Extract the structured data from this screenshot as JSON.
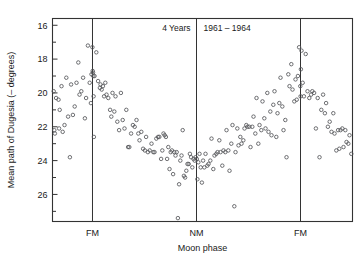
{
  "figure": {
    "title_left": "4 Years",
    "title_right": "1961 – 1964",
    "ylabel": "Mean path of Dugesia (– degrees)",
    "xlabel": "Moon phase",
    "background": "#ffffff",
    "point_color": "#55565a",
    "axis_color": "#333333"
  },
  "chart_data": {
    "type": "scatter",
    "title": "4 Years  1961 – 1964",
    "xlabel": "Moon phase",
    "ylabel": "Mean path of Dugesia (– degrees)",
    "grid": false,
    "legend": null,
    "y_inverted": true,
    "ylim": [
      27.6,
      15.6
    ],
    "yticks": [
      16,
      18,
      20,
      22,
      24,
      26
    ],
    "ytick_labels": [
      "16",
      "18",
      "20",
      "22",
      "24",
      "26"
    ],
    "y_minor_tick_step": 1,
    "xlim": [
      0,
      1
    ],
    "xticks": [
      0.1333,
      0.48,
      0.8267
    ],
    "xtick_labels": [
      "FM",
      "NM",
      "FM"
    ],
    "reference_lines": [
      {
        "label": "FM",
        "x": 0.1333
      },
      {
        "label": "NM",
        "x": 0.48
      },
      {
        "label": "FM",
        "x": 0.8267
      }
    ],
    "n_points": 201,
    "series": [
      {
        "name": "Mean path of Dugesia",
        "marker": "open-circle",
        "points": [
          [
            0.004,
            19.9
          ],
          [
            0.006,
            22.2
          ],
          [
            0.008,
            22.4
          ],
          [
            0.012,
            20.3
          ],
          [
            0.02,
            20.4
          ],
          [
            0.022,
            22.1
          ],
          [
            0.024,
            21.0
          ],
          [
            0.03,
            19.6
          ],
          [
            0.034,
            22.3
          ],
          [
            0.04,
            21.9
          ],
          [
            0.046,
            19.1
          ],
          [
            0.052,
            21.4
          ],
          [
            0.058,
            23.8
          ],
          [
            0.062,
            19.5
          ],
          [
            0.068,
            21.3
          ],
          [
            0.074,
            20.8
          ],
          [
            0.08,
            19.4
          ],
          [
            0.086,
            18.2
          ],
          [
            0.09,
            20.1
          ],
          [
            0.096,
            19.9
          ],
          [
            0.102,
            19.1
          ],
          [
            0.108,
            21.5
          ],
          [
            0.112,
            20.3
          ],
          [
            0.118,
            17.2
          ],
          [
            0.124,
            19.4
          ],
          [
            0.128,
            20.6
          ],
          [
            0.13,
            18.9
          ],
          [
            0.133,
            17.3
          ],
          [
            0.134,
            18.7
          ],
          [
            0.135,
            18.8
          ],
          [
            0.136,
            19.0
          ],
          [
            0.137,
            20.2
          ],
          [
            0.138,
            22.6
          ],
          [
            0.14,
            19.0
          ],
          [
            0.146,
            17.6
          ],
          [
            0.152,
            19.3
          ],
          [
            0.158,
            19.7
          ],
          [
            0.16,
            19.5
          ],
          [
            0.164,
            19.8
          ],
          [
            0.168,
            19.6
          ],
          [
            0.172,
            20.2
          ],
          [
            0.176,
            19.4
          ],
          [
            0.18,
            20.1
          ],
          [
            0.186,
            20.3
          ],
          [
            0.192,
            21.0
          ],
          [
            0.196,
            21.4
          ],
          [
            0.2,
            20.0
          ],
          [
            0.206,
            21.1
          ],
          [
            0.21,
            20.2
          ],
          [
            0.216,
            21.7
          ],
          [
            0.222,
            22.2
          ],
          [
            0.228,
            20.0
          ],
          [
            0.234,
            21.6
          ],
          [
            0.24,
            22.1
          ],
          [
            0.246,
            21.0
          ],
          [
            0.252,
            23.2
          ],
          [
            0.256,
            23.2
          ],
          [
            0.262,
            22.4
          ],
          [
            0.268,
            21.9
          ],
          [
            0.274,
            22.0
          ],
          [
            0.28,
            21.6
          ],
          [
            0.286,
            22.4
          ],
          [
            0.29,
            22.8
          ],
          [
            0.296,
            22.3
          ],
          [
            0.302,
            23.3
          ],
          [
            0.308,
            23.4
          ],
          [
            0.312,
            22.6
          ],
          [
            0.318,
            23.5
          ],
          [
            0.324,
            23.4
          ],
          [
            0.33,
            23.0
          ],
          [
            0.336,
            23.5
          ],
          [
            0.34,
            23.5
          ],
          [
            0.346,
            22.7
          ],
          [
            0.352,
            22.6
          ],
          [
            0.356,
            22.6
          ],
          [
            0.362,
            23.9
          ],
          [
            0.366,
            23.4
          ],
          [
            0.37,
            22.4
          ],
          [
            0.374,
            22.5
          ],
          [
            0.378,
            22.6
          ],
          [
            0.382,
            23.9
          ],
          [
            0.386,
            23.2
          ],
          [
            0.39,
            24.5
          ],
          [
            0.394,
            23.5
          ],
          [
            0.398,
            23.4
          ],
          [
            0.402,
            24.8
          ],
          [
            0.406,
            23.5
          ],
          [
            0.41,
            23.7
          ],
          [
            0.414,
            23.5
          ],
          [
            0.418,
            27.4
          ],
          [
            0.422,
            25.4
          ],
          [
            0.426,
            24.0
          ],
          [
            0.43,
            23.7
          ],
          [
            0.434,
            22.2
          ],
          [
            0.438,
            24.9
          ],
          [
            0.442,
            25.0
          ],
          [
            0.446,
            24.6
          ],
          [
            0.45,
            24.2
          ],
          [
            0.454,
            24.2
          ],
          [
            0.458,
            23.6
          ],
          [
            0.462,
            23.8
          ],
          [
            0.466,
            24.4
          ],
          [
            0.47,
            23.9
          ],
          [
            0.474,
            24.0
          ],
          [
            0.477,
            23.8
          ],
          [
            0.481,
            23.9
          ],
          [
            0.483,
            25.1
          ],
          [
            0.486,
            24.1
          ],
          [
            0.49,
            23.6
          ],
          [
            0.494,
            24.4
          ],
          [
            0.498,
            25.3
          ],
          [
            0.502,
            24.0
          ],
          [
            0.506,
            24.4
          ],
          [
            0.51,
            23.6
          ],
          [
            0.516,
            24.3
          ],
          [
            0.52,
            24.2
          ],
          [
            0.526,
            24.0
          ],
          [
            0.53,
            22.7
          ],
          [
            0.536,
            24.5
          ],
          [
            0.54,
            23.7
          ],
          [
            0.546,
            23.6
          ],
          [
            0.55,
            23.5
          ],
          [
            0.556,
            22.8
          ],
          [
            0.56,
            23.5
          ],
          [
            0.566,
            24.3
          ],
          [
            0.57,
            23.4
          ],
          [
            0.576,
            23.5
          ],
          [
            0.58,
            22.2
          ],
          [
            0.586,
            23.4
          ],
          [
            0.59,
            24.6
          ],
          [
            0.596,
            23.0
          ],
          [
            0.6,
            21.9
          ],
          [
            0.606,
            26.7
          ],
          [
            0.61,
            23.5
          ],
          [
            0.616,
            22.1
          ],
          [
            0.62,
            23.1
          ],
          [
            0.626,
            22.6
          ],
          [
            0.63,
            23.0
          ],
          [
            0.636,
            22.8
          ],
          [
            0.64,
            22.1
          ],
          [
            0.646,
            21.9
          ],
          [
            0.65,
            22.0
          ],
          [
            0.656,
            22.0
          ],
          [
            0.66,
            23.2
          ],
          [
            0.666,
            22.0
          ],
          [
            0.67,
            21.4
          ],
          [
            0.676,
            22.4
          ],
          [
            0.68,
            20.3
          ],
          [
            0.686,
            23.0
          ],
          [
            0.69,
            21.9
          ],
          [
            0.696,
            22.2
          ],
          [
            0.7,
            20.5
          ],
          [
            0.706,
            21.5
          ],
          [
            0.71,
            22.1
          ],
          [
            0.716,
            20.0
          ],
          [
            0.72,
            22.3
          ],
          [
            0.726,
            21.1
          ],
          [
            0.73,
            22.5
          ],
          [
            0.736,
            20.7
          ],
          [
            0.74,
            19.9
          ],
          [
            0.746,
            22.6
          ],
          [
            0.75,
            21.2
          ],
          [
            0.756,
            20.6
          ],
          [
            0.76,
            19.1
          ],
          [
            0.766,
            20.8
          ],
          [
            0.77,
            22.2
          ],
          [
            0.776,
            21.6
          ],
          [
            0.78,
            23.8
          ],
          [
            0.786,
            18.9
          ],
          [
            0.79,
            19.6
          ],
          [
            0.796,
            18.3
          ],
          [
            0.8,
            19.8
          ],
          [
            0.806,
            20.5
          ],
          [
            0.81,
            19.2
          ],
          [
            0.814,
            20.4
          ],
          [
            0.818,
            19.0
          ],
          [
            0.822,
            17.3
          ],
          [
            0.826,
            19.6
          ],
          [
            0.827,
            20.2
          ],
          [
            0.828,
            18.6
          ],
          [
            0.83,
            17.5
          ],
          [
            0.834,
            19.4
          ],
          [
            0.838,
            20.2
          ],
          [
            0.844,
            17.7
          ],
          [
            0.85,
            19.9
          ],
          [
            0.856,
            20.3
          ],
          [
            0.862,
            20.1
          ],
          [
            0.866,
            19.9
          ],
          [
            0.872,
            20.0
          ],
          [
            0.878,
            22.1
          ],
          [
            0.884,
            20.3
          ],
          [
            0.89,
            23.8
          ],
          [
            0.896,
            21.0
          ],
          [
            0.902,
            20.1
          ],
          [
            0.908,
            21.2
          ],
          [
            0.912,
            20.6
          ],
          [
            0.918,
            22.0
          ],
          [
            0.924,
            21.7
          ],
          [
            0.93,
            22.3
          ],
          [
            0.936,
            21.2
          ],
          [
            0.94,
            22.4
          ],
          [
            0.946,
            23.4
          ],
          [
            0.952,
            22.2
          ],
          [
            0.956,
            23.3
          ],
          [
            0.96,
            22.2
          ],
          [
            0.966,
            22.1
          ],
          [
            0.97,
            23.2
          ],
          [
            0.976,
            22.2
          ],
          [
            0.98,
            22.9
          ],
          [
            0.986,
            23.0
          ],
          [
            0.99,
            22.5
          ],
          [
            0.996,
            23.6
          ]
        ]
      }
    ]
  }
}
